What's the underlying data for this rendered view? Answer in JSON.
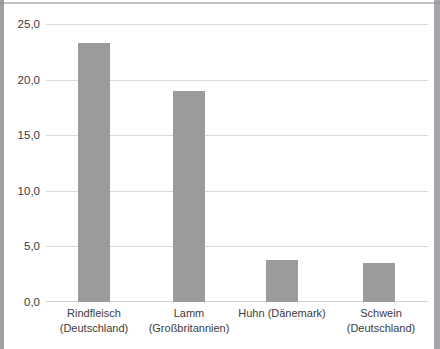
{
  "chart_data": {
    "type": "bar",
    "title": "",
    "subtitle": "",
    "xlabel": "",
    "ylabel": "",
    "categories": [
      "Rindfleisch (Deutschland)",
      "Lamm (Großbritannien)",
      "Huhn (Dänemark)",
      "Schwein (Deutschland)"
    ],
    "category_lines": [
      [
        "Rindfleisch",
        "(Deutschland)"
      ],
      [
        "Lamm",
        "(Großbritannien)"
      ],
      [
        "Huhn (Dänemark)",
        ""
      ],
      [
        "Schwein",
        "(Deutschland)"
      ]
    ],
    "values": [
      23.4,
      19.0,
      3.8,
      3.5
    ],
    "ylim": [
      0.0,
      25.0
    ],
    "yticks": [
      0.0,
      5.0,
      10.0,
      15.0,
      20.0,
      25.0
    ],
    "ytick_labels": [
      "0,0",
      "5,0",
      "10,0",
      "15,0",
      "20,0",
      "25,0"
    ],
    "grid": true,
    "legend": false,
    "legend_position": "none",
    "bar_color": "#9b9b9b",
    "gridline_color": "#d9d9d9",
    "decimal_separator": ","
  },
  "axis": {
    "y": {
      "t0": "0,0",
      "t1": "5,0",
      "t2": "10,0",
      "t3": "15,0",
      "t4": "20,0",
      "t5": "25,0"
    }
  },
  "categories_display": {
    "c0_l1": "Rindfleisch",
    "c0_l2": "(Deutschland)",
    "c1_l1": "Lamm",
    "c1_l2": "(Großbritannien)",
    "c2_l1": "Huhn (Dänemark)",
    "c2_l2": "",
    "c3_l1": "Schwein",
    "c3_l2": "(Deutschland)"
  }
}
